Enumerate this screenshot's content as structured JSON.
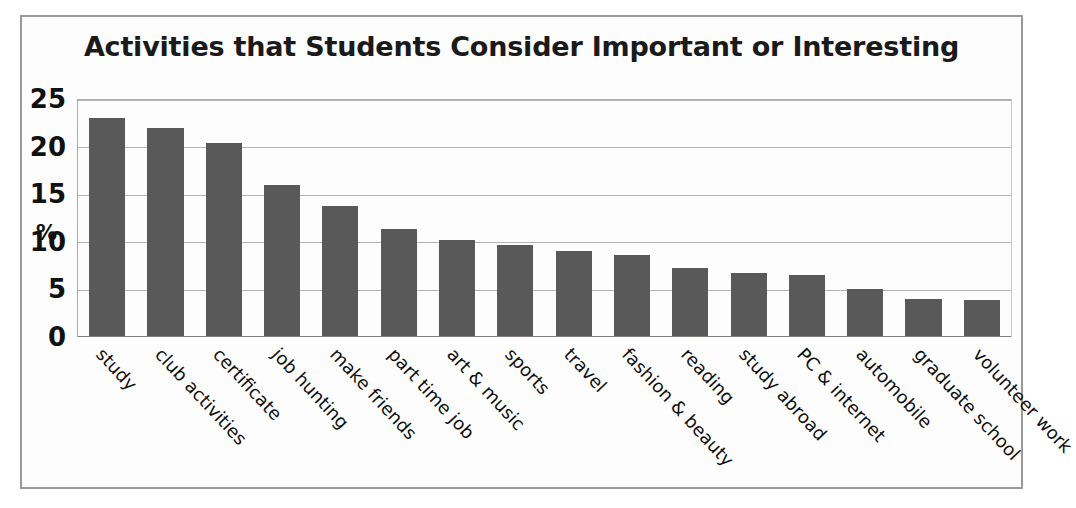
{
  "chart_data": {
    "type": "bar",
    "title": "Activities that Students Consider Important or Interesting",
    "xlabel": "",
    "ylabel": "%",
    "ylim": [
      0,
      25
    ],
    "yticks": [
      25,
      20,
      15,
      10,
      5,
      0
    ],
    "grid": true,
    "legend": "none",
    "bar_color": "#595959",
    "categories": [
      "study",
      "club activities",
      "certificate",
      "job hunting",
      "make friends",
      "part time job",
      "art & music",
      "sports",
      "travel",
      "fashion & beauty",
      "reading",
      "study abroad",
      "PC & internet",
      "automobile",
      "graduate school",
      "volunteer work"
    ],
    "values": [
      23.1,
      22.1,
      20.5,
      16.0,
      13.8,
      11.4,
      10.2,
      9.7,
      9.1,
      8.7,
      7.3,
      6.8,
      6.5,
      5.1,
      4.0,
      3.9
    ]
  }
}
